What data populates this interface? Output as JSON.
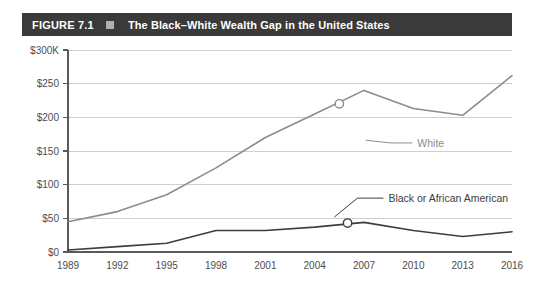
{
  "figure": {
    "number": "FIGURE 7.1",
    "marker_icon": "square-marker-icon",
    "title": "The Black–White Wealth Gap in the United States"
  },
  "colors": {
    "header_bg": "#3a3a3a",
    "header_text": "#ffffff",
    "header_marker": "#b0b0b0",
    "white_series": "#8c8c8c",
    "black_series": "#3d3d3d",
    "gridline": "#cfcfcf",
    "axis": "#5a5a5a",
    "tick_text": "#4d4d4d"
  },
  "chart_data": {
    "type": "line",
    "title": "The Black–White Wealth Gap in the United States",
    "xlabel": "",
    "ylabel": "",
    "x": [
      1989,
      1992,
      1995,
      1998,
      2001,
      2004,
      2007,
      2010,
      2013,
      2016
    ],
    "categories": [
      "1989",
      "1992",
      "1995",
      "1998",
      "2001",
      "2004",
      "2007",
      "2010",
      "2013",
      "2016"
    ],
    "xlim": [
      1989,
      2016
    ],
    "ylim": [
      0,
      300
    ],
    "yticks": [
      0,
      50,
      100,
      150,
      200,
      250,
      300
    ],
    "ytick_labels": [
      "$0",
      "$50",
      "$100",
      "$150",
      "$200",
      "$250",
      "$300K"
    ],
    "grid": true,
    "legend": "inline-annotations",
    "series": [
      {
        "name": "White",
        "color": "#8c8c8c",
        "values": [
          45,
          60,
          85,
          125,
          170,
          205,
          240,
          213,
          203,
          262
        ],
        "label_text": "White",
        "marker_point": {
          "x": 2005.5,
          "y": 220
        }
      },
      {
        "name": "Black or African American",
        "color": "#3d3d3d",
        "values": [
          3,
          8,
          13,
          32,
          32,
          37,
          44,
          32,
          23,
          30
        ],
        "label_text": "Black or African American",
        "marker_point": {
          "x": 2006,
          "y": 43
        }
      }
    ],
    "annotations": [
      {
        "text": "White",
        "series": "White"
      },
      {
        "text": "Black or African American",
        "series": "Black or African American"
      }
    ]
  }
}
